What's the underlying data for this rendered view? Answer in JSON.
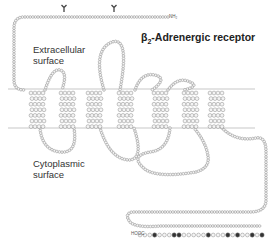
{
  "title": {
    "prefix": "β",
    "sub": "2",
    "rest": "-Adrenergic receptor"
  },
  "labels": {
    "extracellular_line1": "Extracellular",
    "extracellular_line2": "surface",
    "cytoplasmic_line1": "Cytoplasmic",
    "cytoplasmic_line2": "surface",
    "n_terminus": "NH₂",
    "c_terminus": "HOOC"
  },
  "colors": {
    "membrane_line": "#c8c8c8",
    "residue_stroke": "#8a8a8a",
    "residue_fill": "#f4f4f4",
    "phospho_fill": "#333333",
    "text": "#333333"
  },
  "membrane": {
    "top_y": 89,
    "bottom_y": 128
  },
  "glycosylation_sites": [
    {
      "x": 64,
      "y": 9
    },
    {
      "x": 114,
      "y": 9
    }
  ],
  "helices": [
    {
      "x": 37
    },
    {
      "x": 67
    },
    {
      "x": 94
    },
    {
      "x": 125
    },
    {
      "x": 160
    },
    {
      "x": 190
    },
    {
      "x": 216
    }
  ],
  "chains": [
    {
      "name": "n-terminus",
      "d": "M168,17 L24,17 Q14,17 14,28 L14,80 Q14,90 24,90"
    },
    {
      "name": "ecl1",
      "d": "M45,90 Q52,68 60,70 Q68,72 62,90"
    },
    {
      "name": "ecl2",
      "d": "M104,90 Q92,50 112,42 Q130,36 120,90"
    },
    {
      "name": "ecl3",
      "d": "M168,90 Q178,76 190,82 Q200,86 184,90"
    },
    {
      "name": "ecl-right",
      "d": "M135,90 Q142,70 158,76 Q166,80 152,90"
    },
    {
      "name": "icl1",
      "d": "M40,128 Q42,150 60,152 Q78,154 74,128"
    },
    {
      "name": "icl2",
      "d": "M100,128 Q110,160 130,160 Q144,158 134,128"
    },
    {
      "name": "icl3",
      "d": "M170,128 Q168,150 150,152 Q128,156 146,170 Q160,178 196,172"
    },
    {
      "name": "c-tail",
      "d": "M222,128 Q236,142 256,138 Q266,136 266,152 L266,200 Q266,212 250,212 L132,212 Q124,214 130,222 Q136,228 160,226 L262,226"
    },
    {
      "name": "icl3-return",
      "d": "M196,172 Q210,168 208,156 Q206,142 194,128"
    }
  ],
  "c_terminal_row": {
    "x_start": 140,
    "x_end": 262,
    "y": 235,
    "count": 26,
    "phospho_indices": [
      3,
      7,
      8,
      14,
      18,
      20,
      23,
      25
    ]
  }
}
